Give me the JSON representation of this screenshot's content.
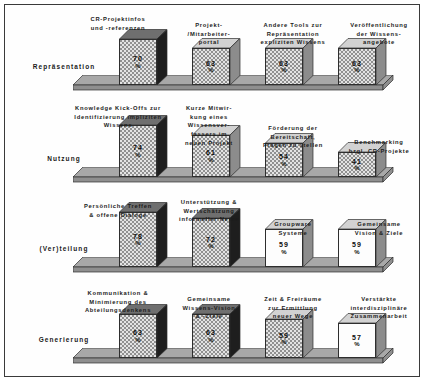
{
  "chart_data": {
    "type": "bar",
    "title": "",
    "xlabel": "",
    "ylabel": "",
    "ylim": [
      0,
      100
    ],
    "grid": false,
    "legend": "none",
    "unit": "%",
    "groups": [
      {
        "name": "Repräsentation",
        "categories": [
          "CR-Projektinfos\nund -referenzen",
          "Projekt-\n/Mitarbeiter-\nportal",
          "Andere Tools zur\nRepräsentation\nexpliziten Wissens",
          "Veröffentlichung\nder Wissens-\nangebote"
        ],
        "values": [
          70,
          63,
          63,
          63
        ]
      },
      {
        "name": "Nutzung",
        "categories": [
          "Knowledge Kick-Offs zur\nIdentifizierung impliziten\nWissens",
          "Kurze Mitwir-\nkung eines\nWissensver-\nfassers im\nneuen Projekt",
          "Förderung der\nBereitschaft,\nFragen zu stellen",
          "Benchmarking\nbzgl. CR-Projekte"
        ],
        "values": [
          74,
          61,
          54,
          41
        ]
      },
      {
        "name": "(Ver)teilung",
        "categories": [
          "Persönliche Treffen\n& offene Dialoge",
          "Unterstützung &\nWertschätzung\ninformeller Netze",
          "Groupware\nSysteme",
          "Gemeinsame\nVision & Ziele"
        ],
        "values": [
          78,
          72,
          59,
          59
        ]
      },
      {
        "name": "Generierung",
        "categories": [
          "Kommunikation &\nMinimierung des\nAbteilungsdenkens",
          "Gemeinsame\nWissens-Vision\n& -Ziele",
          "Zeit & Freiräume\nzur Ermittlung\nneuer Wege",
          "Verstärkte\ninterdisziplinäre\nZusammenarbeit"
        ],
        "values": [
          63,
          63,
          59,
          57
        ]
      }
    ]
  },
  "rows": [
    {
      "label": "Repräsentation",
      "bars": [
        {
          "cap": "CR-Projektinfos\nund -referenzen",
          "value": "70",
          "pct": "%"
        },
        {
          "cap": "Projekt-\n/Mitarbeiter-\nportal",
          "value": "63",
          "pct": "%"
        },
        {
          "cap": "Andere Tools zur\nRepräsentation\nexpliziten Wissens",
          "value": "63",
          "pct": "%"
        },
        {
          "cap": "Veröffentlichung\nder Wissens-\nangebote",
          "value": "63",
          "pct": "%"
        }
      ]
    },
    {
      "label": "Nutzung",
      "bars": [
        {
          "cap": "Knowledge Kick-Offs zur\nIdentifizierung impliziten\nWissens",
          "value": "74",
          "pct": "%"
        },
        {
          "cap": "Kurze Mitwir-\nkung eines\nWissensver-\nfassers im\nneuen Projekt",
          "value": "61",
          "pct": "%"
        },
        {
          "cap": "Förderung der\nBereitschaft,\nFragen zu stellen",
          "value": "54",
          "pct": "%"
        },
        {
          "cap": "Benchmarking\nbzgl. CR-Projekte",
          "value": "41",
          "pct": "%"
        }
      ]
    },
    {
      "label": "(Ver)teilung",
      "bars": [
        {
          "cap": "Persönliche Treffen\n& offene Dialoge",
          "value": "78",
          "pct": "%"
        },
        {
          "cap": "Unterstützung &\nWertschätzung\ninformeller Netze",
          "value": "72",
          "pct": "%"
        },
        {
          "cap": "Groupware\nSysteme",
          "value": "59",
          "pct": "%"
        },
        {
          "cap": "Gemeinsame\nVision & Ziele",
          "value": "59",
          "pct": "%"
        }
      ]
    },
    {
      "label": "Generierung",
      "bars": [
        {
          "cap": "Kommunikation &\nMinimierung des\nAbteilungsdenkens",
          "value": "63",
          "pct": "%"
        },
        {
          "cap": "Gemeinsame\nWissens-Vision\n& -Ziele",
          "value": "63",
          "pct": "%"
        },
        {
          "cap": "Zeit & Freiräume\nzur Ermittlung\nneuer Wege",
          "value": "59",
          "pct": "%"
        },
        {
          "cap": "Verstärkte\ninterdisziplinäre\nZusammenarbeit",
          "value": "57",
          "pct": "%"
        }
      ]
    }
  ],
  "colors": {
    "bar_face_dotted": "#e3e3e3",
    "bar_face_plain": "#fdfdfd",
    "bar_side_dark": "#1e1e1e",
    "bar_side_gray": "#8c8c8c",
    "platform_top": "#a8a8a8",
    "platform_front": "#8f8f8f",
    "outline": "#2e2e2e",
    "text": "#1a1a1a",
    "frame": "#3a3a3a",
    "background": "#ffffff"
  }
}
